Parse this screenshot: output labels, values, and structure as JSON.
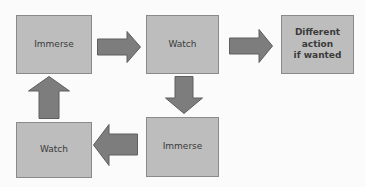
{
  "diagram": {
    "type": "flowchart",
    "colors": {
      "box_fill": "#bdbdbd",
      "box_border": "#8a8a8a",
      "arrow_fill": "#7d7d7d",
      "arrow_border": "#5e5e5e",
      "text": "#3a3a3a",
      "background": "#fbfbfb"
    },
    "nodes": [
      {
        "id": "immerse-1",
        "label": "Immerse"
      },
      {
        "id": "watch-1",
        "label": "Watch"
      },
      {
        "id": "different-action",
        "label_lines": [
          "Different",
          "action",
          "if wanted"
        ]
      },
      {
        "id": "immerse-2",
        "label": "Immerse"
      },
      {
        "id": "watch-2",
        "label": "Watch"
      }
    ],
    "edges": [
      {
        "from": "immerse-1",
        "to": "watch-1",
        "direction": "right"
      },
      {
        "from": "watch-1",
        "to": "different-action",
        "direction": "right"
      },
      {
        "from": "watch-1",
        "to": "immerse-2",
        "direction": "down"
      },
      {
        "from": "immerse-2",
        "to": "watch-2",
        "direction": "left"
      },
      {
        "from": "watch-2",
        "to": "immerse-1",
        "direction": "up"
      }
    ]
  }
}
